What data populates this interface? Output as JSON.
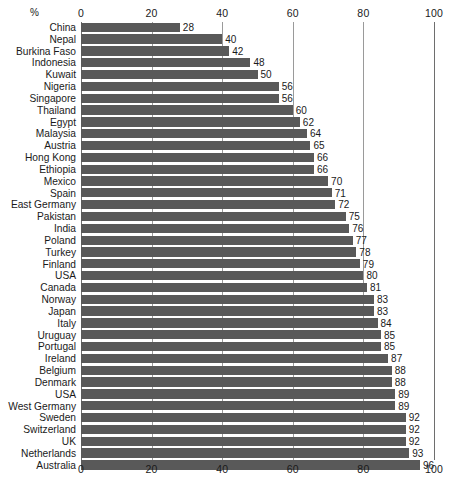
{
  "chart_data": {
    "type": "bar",
    "orientation": "horizontal",
    "title": "",
    "subtitle": "",
    "xlabel": "%",
    "ylabel": "",
    "xlim": [
      0,
      100
    ],
    "xticks": [
      0,
      20,
      40,
      60,
      80,
      100
    ],
    "xtick_labels": [
      "0",
      "20",
      "40",
      "60",
      "80",
      "100"
    ],
    "grid": true,
    "grid_axis": "x",
    "legend": false,
    "legend_position": "none",
    "axis_position": "both",
    "value_labels": true,
    "bar_color": "#595959",
    "categories": [
      "China",
      "Nepal",
      "Burkina Faso",
      "Indonesia",
      "Kuwait",
      "Nigeria",
      "Singapore",
      "Thailand",
      "Egypt",
      "Malaysia",
      "Austria",
      "Hong Kong",
      "Ethiopia",
      "Mexico",
      "Spain",
      "East Germany",
      "Pakistan",
      "India",
      "Poland",
      "Turkey",
      "Finland",
      "USA",
      "Canada",
      "Norway",
      "Japan",
      "Italy",
      "Uruguay",
      "Portugal",
      "Ireland",
      "Belgium",
      "Denmark",
      "USA",
      "West Germany",
      "Sweden",
      "Switzerland",
      "UK",
      "Netherlands",
      "Australia"
    ],
    "values": [
      28,
      40,
      42,
      48,
      50,
      56,
      56,
      60,
      62,
      64,
      65,
      66,
      66,
      70,
      71,
      72,
      75,
      76,
      77,
      78,
      79,
      80,
      81,
      83,
      83,
      84,
      85,
      85,
      87,
      88,
      88,
      89,
      89,
      92,
      92,
      92,
      93,
      96
    ]
  },
  "axis": {
    "percent_symbol": "%"
  }
}
